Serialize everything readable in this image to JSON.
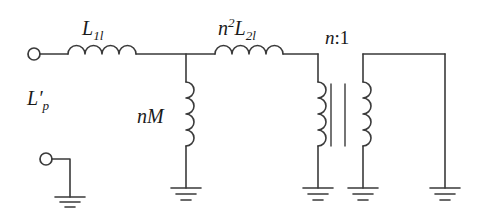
{
  "figure": {
    "type": "circuit-schematic",
    "stroke_color": "#3a3a3a",
    "background_color": "#ffffff",
    "width": 481,
    "height": 219
  },
  "labels": {
    "series_inductor_1": {
      "base": "L",
      "subscript": "1l",
      "display": "L1l"
    },
    "series_inductor_2": {
      "base": "L",
      "prefix": "n",
      "prefix_exponent": "2",
      "subscript": "2l",
      "display": "n2L2l"
    },
    "shunt_inductor": {
      "display": "nM"
    },
    "transformer_ratio": {
      "display": "n:1",
      "n": "n",
      "colon": ":",
      "one": "1"
    },
    "port_label": {
      "base": "L",
      "prime": "′",
      "subscript": "p",
      "display": "Lp'"
    }
  },
  "components": [
    {
      "name": "input-terminal-top",
      "type": "terminal-circle",
      "cx": 34,
      "cy": 54,
      "r": 6
    },
    {
      "name": "input-terminal-bottom",
      "type": "terminal-circle",
      "cx": 46,
      "cy": 159,
      "r": 6
    },
    {
      "name": "inductor-l1l",
      "type": "inductor-horizontal",
      "x1": 68,
      "x2": 136,
      "y": 54,
      "bumps": 4
    },
    {
      "name": "inductor-nm",
      "type": "inductor-vertical",
      "x": 186,
      "y1": 82,
      "y2": 146,
      "bumps": 4
    },
    {
      "name": "inductor-n2l2l",
      "type": "inductor-horizontal",
      "x1": 215,
      "x2": 283,
      "y": 54,
      "bumps": 4
    },
    {
      "name": "transformer-primary-coil",
      "type": "inductor-vertical",
      "x": 318,
      "y1": 82,
      "y2": 146,
      "bumps": 4
    },
    {
      "name": "transformer-core-bar-left",
      "type": "core-bar",
      "x": 331,
      "y1": 84,
      "y2": 146
    },
    {
      "name": "transformer-core-bar-right",
      "type": "core-bar",
      "x": 345,
      "y1": 84,
      "y2": 146
    },
    {
      "name": "transformer-secondary-coil",
      "type": "inductor-vertical",
      "x": 363,
      "y1": 82,
      "y2": 146,
      "bumps": 4
    },
    {
      "name": "ground-input",
      "type": "ground",
      "x": 70,
      "y": 197
    },
    {
      "name": "ground-nm",
      "type": "ground",
      "x": 186,
      "y": 188
    },
    {
      "name": "ground-primary",
      "type": "ground",
      "x": 318,
      "y": 188
    },
    {
      "name": "ground-secondary",
      "type": "ground",
      "x": 363,
      "y": 188
    },
    {
      "name": "ground-output",
      "type": "ground",
      "x": 445,
      "y": 188
    }
  ],
  "wires": [
    {
      "name": "wire-input-to-l1l",
      "points": "40,54 68,54"
    },
    {
      "name": "wire-l1l-to-node",
      "points": "136,54 215,54"
    },
    {
      "name": "wire-node-to-nm",
      "points": "186,54 186,82"
    },
    {
      "name": "wire-nm-to-ground",
      "points": "186,146 186,188"
    },
    {
      "name": "wire-l2l-to-primary",
      "points": "283,54 318,54"
    },
    {
      "name": "wire-primary-down",
      "points": "318,54 318,82"
    },
    {
      "name": "wire-primary-to-ground",
      "points": "318,146 318,188"
    },
    {
      "name": "wire-secondary-top",
      "points": "363,54 445,54"
    },
    {
      "name": "wire-secondary-down",
      "points": "363,54 363,82"
    },
    {
      "name": "wire-secondary-to-ground",
      "points": "363,146 363,188"
    },
    {
      "name": "wire-output-right-down",
      "points": "445,54 445,188"
    },
    {
      "name": "wire-terminal-bottom-right",
      "points": "52,159 70,159"
    },
    {
      "name": "wire-terminal-bottom-down",
      "points": "70,159 70,197"
    }
  ]
}
